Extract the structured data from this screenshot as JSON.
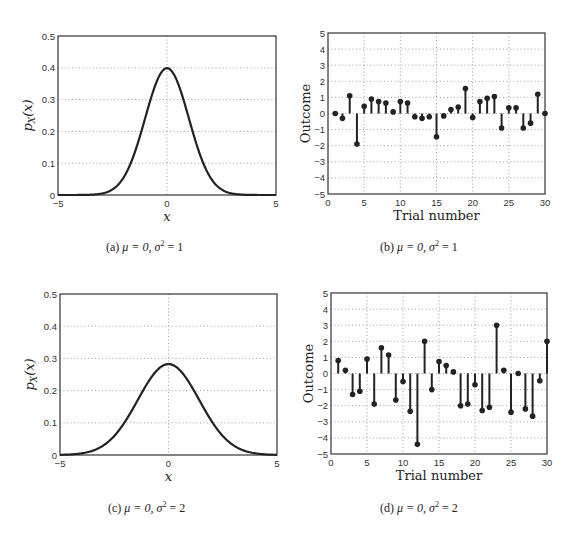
{
  "chart_data": [
    {
      "id": "a",
      "type": "line",
      "caption": "(a) μ = 0, σ² = 1",
      "xlabel": "x",
      "ylabel": "p_X(x)",
      "xlim": [
        -5,
        5
      ],
      "ylim": [
        0,
        0.5
      ],
      "xticks": [
        -5,
        0,
        5
      ],
      "yticks": [
        0,
        0.1,
        0.2,
        0.3,
        0.4,
        0.5
      ],
      "grid": true,
      "series": [
        {
          "name": "Gaussian pdf",
          "mu": 0,
          "variance": 1,
          "peak": 0.399
        }
      ],
      "box": {
        "left": 58,
        "top": 36,
        "right": 276,
        "bottom": 195
      }
    },
    {
      "id": "b",
      "type": "stem",
      "caption": "(b) μ = 0, σ² = 1",
      "xlabel": "Trial number",
      "ylabel": "Outcome",
      "xlim": [
        0,
        30
      ],
      "ylim": [
        -5,
        5
      ],
      "xticks": [
        0,
        5,
        10,
        15,
        20,
        25,
        30
      ],
      "yticks": [
        -5,
        -4,
        -3,
        -2,
        -1,
        0,
        1,
        2,
        3,
        4,
        5
      ],
      "grid": true,
      "x": [
        1,
        2,
        3,
        4,
        5,
        6,
        7,
        8,
        9,
        10,
        11,
        12,
        13,
        14,
        15,
        16,
        17,
        18,
        19,
        20,
        21,
        22,
        23,
        24,
        25,
        26,
        27,
        28,
        29,
        30
      ],
      "values": [
        0.0,
        -0.3,
        1.1,
        -1.9,
        0.45,
        0.9,
        0.75,
        0.65,
        0.1,
        0.75,
        0.65,
        -0.2,
        -0.3,
        -0.2,
        -1.45,
        -0.15,
        0.25,
        0.4,
        1.55,
        -0.25,
        0.75,
        0.95,
        1.05,
        -0.9,
        0.35,
        0.35,
        -0.9,
        -0.6,
        1.2,
        0.0
      ],
      "box": {
        "left": 328,
        "top": 33,
        "right": 545,
        "bottom": 194
      }
    },
    {
      "id": "c",
      "type": "line",
      "caption": "(c) μ = 0, σ² = 2",
      "xlabel": "x",
      "ylabel": "p_X(x)",
      "xlim": [
        -5,
        5
      ],
      "ylim": [
        0,
        0.5
      ],
      "xticks": [
        -5,
        0,
        5
      ],
      "yticks": [
        0,
        0.1,
        0.2,
        0.3,
        0.4,
        0.5
      ],
      "grid": true,
      "series": [
        {
          "name": "Gaussian pdf",
          "mu": 0,
          "variance": 2,
          "peak": 0.2
        }
      ],
      "box": {
        "left": 60,
        "top": 294,
        "right": 277,
        "bottom": 455
      }
    },
    {
      "id": "d",
      "type": "stem",
      "caption": "(d) μ = 0, σ² = 2",
      "xlabel": "Trial number",
      "ylabel": "Outcome",
      "xlim": [
        0,
        30
      ],
      "ylim": [
        -5,
        5
      ],
      "xticks": [
        0,
        5,
        10,
        15,
        20,
        25,
        30
      ],
      "yticks": [
        -5,
        -4,
        -3,
        -2,
        -1,
        0,
        1,
        2,
        3,
        4,
        5
      ],
      "grid": true,
      "x": [
        1,
        2,
        3,
        4,
        5,
        6,
        7,
        8,
        9,
        10,
        11,
        12,
        13,
        14,
        15,
        16,
        17,
        18,
        19,
        20,
        21,
        22,
        23,
        24,
        25,
        26,
        27,
        28,
        29,
        30
      ],
      "values": [
        0.8,
        0.2,
        -1.3,
        -1.1,
        0.9,
        -1.9,
        1.6,
        1.15,
        -1.65,
        -0.5,
        -2.35,
        -4.4,
        2.0,
        -1.0,
        0.75,
        0.5,
        0.1,
        -2.0,
        -1.9,
        -0.7,
        -2.3,
        -2.1,
        3.0,
        0.2,
        -2.4,
        0.0,
        -2.2,
        -2.65,
        -0.45,
        2.0
      ],
      "box": {
        "left": 331,
        "top": 293,
        "right": 547,
        "bottom": 454
      }
    }
  ],
  "captions": {
    "a": {
      "label": "(a)",
      "mu": "μ = 0, σ",
      "sup": "2",
      "rest": " = 1"
    },
    "b": {
      "label": "(b)",
      "mu": "μ = 0, σ",
      "sup": "2",
      "rest": " = 1"
    },
    "c": {
      "label": "(c)",
      "mu": "μ = 0, σ",
      "sup": "2",
      "rest": " = 2"
    },
    "d": {
      "label": "(d)",
      "mu": "μ = 0, σ",
      "sup": "2",
      "rest": " = 2"
    }
  },
  "colors": {
    "curve": "#222222",
    "axis": "#333333",
    "grid": "#888888"
  }
}
